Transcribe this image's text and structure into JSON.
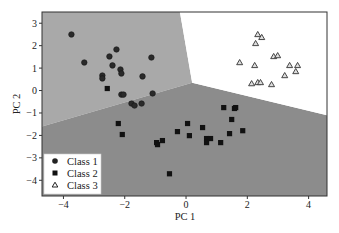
{
  "chart_data": {
    "type": "scatter",
    "title": "",
    "xlabel": "PC 1",
    "ylabel": "PC 2",
    "xlim": [
      -4.7,
      4.6
    ],
    "ylim": [
      -4.7,
      3.5
    ],
    "xticks": [
      -4,
      -2,
      0,
      2,
      4
    ],
    "yticks": [
      -4,
      -3,
      -2,
      -1,
      0,
      1,
      2,
      3
    ],
    "xtick_labels": [
      "−4",
      "−2",
      "0",
      "2",
      "4"
    ],
    "ytick_labels": [
      "−4",
      "−3",
      "−2",
      "−1",
      "0",
      "1",
      "2",
      "3"
    ],
    "grid": false,
    "legend_position": "lower left",
    "decision_regions": [
      {
        "class": "Class 1",
        "color": "#a9a9a9",
        "polygon": [
          [
            -4.7,
            3.5
          ],
          [
            -0.2,
            3.5
          ],
          [
            0.2,
            0.35
          ],
          [
            -4.7,
            -1.6
          ]
        ]
      },
      {
        "class": "Class 2",
        "color": "#8c8c8c",
        "polygon": [
          [
            -4.7,
            -1.6
          ],
          [
            0.2,
            0.35
          ],
          [
            4.6,
            -1.1
          ],
          [
            4.6,
            -4.7
          ],
          [
            -4.7,
            -4.7
          ]
        ]
      },
      {
        "class": "Class 3",
        "color": "#ffffff",
        "polygon": [
          [
            -0.2,
            3.5
          ],
          [
            4.6,
            3.5
          ],
          [
            4.6,
            -1.1
          ],
          [
            0.2,
            0.35
          ]
        ]
      }
    ],
    "series": [
      {
        "name": "Class 1",
        "marker": "circle",
        "points": [
          [
            -3.74,
            2.5
          ],
          [
            -3.32,
            1.25
          ],
          [
            -2.27,
            1.83
          ],
          [
            -2.5,
            1.52
          ],
          [
            -2.4,
            1.12
          ],
          [
            -1.13,
            1.47
          ],
          [
            -2.14,
            0.94
          ],
          [
            -2.11,
            0.76
          ],
          [
            -2.73,
            0.67
          ],
          [
            -2.73,
            0.54
          ],
          [
            -1.42,
            0.63
          ],
          [
            -2.11,
            -0.18
          ],
          [
            -2.04,
            -0.18
          ],
          [
            -1.09,
            -0.13
          ],
          [
            -1.78,
            -0.58
          ],
          [
            -1.68,
            -0.67
          ],
          [
            -1.45,
            -0.58
          ]
        ]
      },
      {
        "name": "Class 2",
        "marker": "square",
        "points": [
          [
            -2.57,
            0.09
          ],
          [
            -2.21,
            -1.47
          ],
          [
            -2.08,
            -1.96
          ],
          [
            -0.96,
            -2.32
          ],
          [
            -0.93,
            -2.41
          ],
          [
            -0.77,
            -2.23
          ],
          [
            -0.28,
            -1.83
          ],
          [
            0.05,
            -1.47
          ],
          [
            0.11,
            -2.01
          ],
          [
            0.54,
            -1.65
          ],
          [
            0.67,
            -2.14
          ],
          [
            0.8,
            -2.14
          ],
          [
            0.67,
            -2.32
          ],
          [
            1.13,
            -2.32
          ],
          [
            1.23,
            -0.76
          ],
          [
            1.58,
            -0.8
          ],
          [
            1.62,
            -0.76
          ],
          [
            1.49,
            -1.29
          ],
          [
            1.42,
            -1.92
          ],
          [
            1.85,
            -1.79
          ],
          [
            -0.54,
            -3.71
          ]
        ]
      },
      {
        "name": "Class 3",
        "marker": "triangle",
        "points": [
          [
            2.34,
            2.5
          ],
          [
            2.47,
            2.37
          ],
          [
            2.27,
            2.1
          ],
          [
            2.86,
            1.52
          ],
          [
            2.99,
            1.56
          ],
          [
            1.75,
            1.25
          ],
          [
            2.24,
            1.12
          ],
          [
            3.38,
            1.12
          ],
          [
            3.64,
            1.12
          ],
          [
            3.58,
            0.85
          ],
          [
            3.22,
            0.67
          ],
          [
            2.14,
            0.31
          ],
          [
            2.34,
            0.36
          ],
          [
            2.43,
            0.36
          ],
          [
            2.79,
            0.27
          ]
        ]
      }
    ]
  },
  "legend": {
    "items": [
      {
        "label": "Class 1",
        "marker": "circle"
      },
      {
        "label": "Class 2",
        "marker": "square"
      },
      {
        "label": "Class 3",
        "marker": "triangle"
      }
    ]
  },
  "axes": {
    "xlabel": "PC 1",
    "ylabel": "PC 2"
  }
}
